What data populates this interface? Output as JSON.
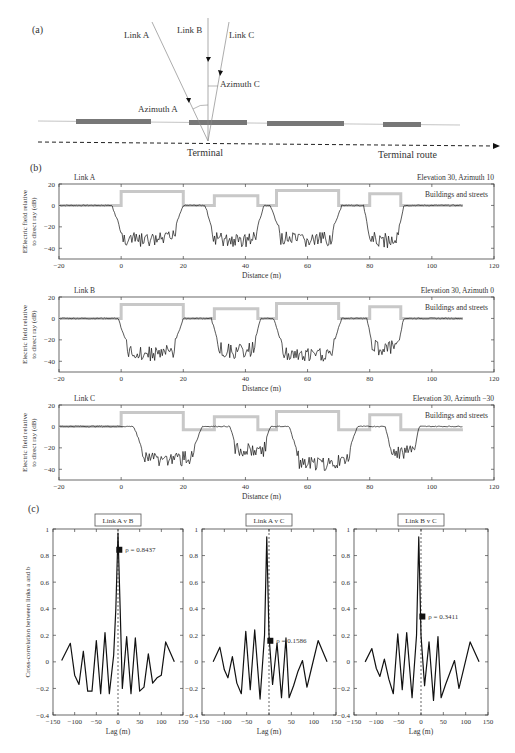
{
  "figure": {
    "panel_labels": {
      "a": "(a)",
      "b": "(b)",
      "c": "(c)"
    }
  },
  "diagram": {
    "links": [
      {
        "name": "Link A",
        "azimuth_label": "Azimuth A"
      },
      {
        "name": "Link B"
      },
      {
        "name": "Link C",
        "azimuth_label": "Azimuth C"
      }
    ],
    "terminal_label": "Terminal",
    "route_label": "Terminal route"
  },
  "chart_data": [
    {
      "type": "line",
      "panel": "b",
      "title": "Link A",
      "subtitle": "Elevation 30, Azimuth 10",
      "legend": "Buildings and streets",
      "xlabel": "Distance (m)",
      "ylabel": "EElectric field relative to direct ray (dB)",
      "xlim": [
        -20,
        120
      ],
      "ylim": [
        -50,
        20
      ],
      "xticks": [
        -20,
        0,
        20,
        40,
        60,
        80,
        100,
        120
      ],
      "yticks": [
        -40,
        -20,
        0,
        20
      ],
      "buildings": [
        [
          -20,
          0
        ],
        [
          0,
          0
        ],
        [
          0,
          13
        ],
        [
          20,
          13
        ],
        [
          20,
          0
        ],
        [
          30,
          0
        ],
        [
          30,
          9
        ],
        [
          44,
          9
        ],
        [
          44,
          0
        ],
        [
          50,
          0
        ],
        [
          50,
          14
        ],
        [
          70,
          14
        ],
        [
          70,
          0
        ],
        [
          80,
          0
        ],
        [
          80,
          11
        ],
        [
          90,
          11
        ],
        [
          90,
          0
        ],
        [
          110,
          0
        ]
      ],
      "field_dips": [
        {
          "start": -3,
          "end": 20,
          "min": -30
        },
        {
          "start": 27,
          "end": 46,
          "min": -30
        },
        {
          "start": 48,
          "end": 71,
          "min": -30
        },
        {
          "start": 78,
          "end": 91,
          "min": -30
        }
      ]
    },
    {
      "type": "line",
      "panel": "b",
      "title": "Link B",
      "subtitle": "Elevation 30, Azimuth 0",
      "legend": "Buildings and streets",
      "xlabel": "Distance (m)",
      "ylabel": "Electric field relative to direct ray (dB)",
      "xlim": [
        -20,
        120
      ],
      "ylim": [
        -50,
        20
      ],
      "xticks": [
        -20,
        0,
        20,
        40,
        60,
        80,
        100,
        120
      ],
      "yticks": [
        -40,
        -20,
        0,
        20
      ],
      "buildings": [
        [
          -20,
          0
        ],
        [
          0,
          0
        ],
        [
          0,
          13
        ],
        [
          20,
          13
        ],
        [
          20,
          0
        ],
        [
          30,
          0
        ],
        [
          30,
          9
        ],
        [
          44,
          9
        ],
        [
          44,
          0
        ],
        [
          50,
          0
        ],
        [
          50,
          14
        ],
        [
          70,
          14
        ],
        [
          70,
          0
        ],
        [
          80,
          0
        ],
        [
          80,
          11
        ],
        [
          90,
          11
        ],
        [
          90,
          0
        ],
        [
          110,
          0
        ]
      ],
      "field_dips": [
        {
          "start": -1,
          "end": 20,
          "min": -30
        },
        {
          "start": 29,
          "end": 45,
          "min": -28
        },
        {
          "start": 49,
          "end": 71,
          "min": -32
        },
        {
          "start": 79,
          "end": 91,
          "min": -25
        }
      ]
    },
    {
      "type": "line",
      "panel": "b",
      "title": "Link C",
      "subtitle": "Elevation 30, Azimuth −30",
      "legend": "Buildings and streets",
      "xlabel": "Distance (m)",
      "ylabel": "Electric field relative to direct ray (dB)",
      "xlim": [
        -20,
        120
      ],
      "ylim": [
        -50,
        20
      ],
      "xticks": [
        -20,
        0,
        20,
        40,
        60,
        80,
        100,
        120
      ],
      "yticks": [
        -40,
        -20,
        0,
        20
      ],
      "buildings": [
        [
          -20,
          0
        ],
        [
          0,
          0
        ],
        [
          0,
          13
        ],
        [
          20,
          13
        ],
        [
          20,
          -3
        ],
        [
          30,
          -3
        ],
        [
          30,
          9
        ],
        [
          44,
          9
        ],
        [
          44,
          -3
        ],
        [
          50,
          -3
        ],
        [
          50,
          14
        ],
        [
          70,
          14
        ],
        [
          70,
          -3
        ],
        [
          80,
          -3
        ],
        [
          80,
          11
        ],
        [
          90,
          11
        ],
        [
          90,
          -3
        ],
        [
          110,
          -3
        ]
      ],
      "field_dips": [
        {
          "start": 4,
          "end": 26,
          "min": -28
        },
        {
          "start": 35,
          "end": 48,
          "min": -20
        },
        {
          "start": 54,
          "end": 76,
          "min": -32
        },
        {
          "start": 85,
          "end": 96,
          "min": -22
        }
      ]
    },
    {
      "type": "line",
      "panel": "c",
      "title": "Link A v B",
      "xlabel": "Lag (m)",
      "ylabel": "Cross-correlation between links a and b",
      "xlim": [
        -150,
        150
      ],
      "ylim": [
        -0.4,
        1
      ],
      "xticks": [
        -150,
        -100,
        -50,
        0,
        50,
        100,
        150
      ],
      "yticks": [
        -0.4,
        -0.2,
        0,
        0.2,
        0.4,
        0.6,
        0.8,
        1
      ],
      "x": [
        -130,
        -110,
        -100,
        -90,
        -80,
        -70,
        -60,
        -50,
        -40,
        -30,
        -20,
        -10,
        -5,
        0,
        5,
        10,
        20,
        30,
        40,
        50,
        60,
        70,
        80,
        90,
        100,
        110,
        130
      ],
      "y": [
        0.01,
        0.14,
        -0.1,
        -0.17,
        0.08,
        -0.22,
        -0.22,
        0.16,
        -0.24,
        0.22,
        -0.24,
        0.05,
        0.4,
        0.97,
        0.4,
        -0.2,
        0.19,
        -0.24,
        0.18,
        -0.22,
        -0.19,
        0.06,
        -0.16,
        -0.12,
        -0.1,
        0.15,
        0.0
      ],
      "marker": {
        "x": 3,
        "y": 0.8437,
        "label": "ρ = 0.8437"
      }
    },
    {
      "type": "line",
      "panel": "c",
      "title": "Link A v C",
      "xlabel": "Lag (m)",
      "ylabel": "",
      "xlim": [
        -150,
        150
      ],
      "ylim": [
        -0.4,
        1
      ],
      "xticks": [
        -150,
        -100,
        -50,
        0,
        50,
        100,
        150
      ],
      "yticks": [
        -0.4,
        -0.2,
        0,
        0.2,
        0.4,
        0.6,
        0.8,
        1
      ],
      "x": [
        -125,
        -110,
        -100,
        -92,
        -82,
        -72,
        -62,
        -52,
        -42,
        -32,
        -20,
        -10,
        -5,
        0,
        8,
        18,
        28,
        38,
        45,
        55,
        65,
        75,
        85,
        95,
        110,
        130
      ],
      "y": [
        0.0,
        0.11,
        -0.06,
        -0.12,
        0.04,
        -0.16,
        -0.24,
        0.23,
        -0.21,
        0.24,
        -0.28,
        0.2,
        0.94,
        0.2,
        -0.17,
        0.14,
        -0.27,
        0.18,
        -0.27,
        -0.18,
        -0.07,
        0.01,
        -0.19,
        -0.05,
        0.16,
        0.0
      ],
      "marker": {
        "x": 3,
        "y": 0.1586,
        "label": "ρ = 0.1586"
      }
    },
    {
      "type": "line",
      "panel": "c",
      "title": "Link B v C",
      "xlabel": "Lag (m)",
      "ylabel": "",
      "xlim": [
        -150,
        150
      ],
      "ylim": [
        -0.4,
        1
      ],
      "xticks": [
        -150,
        -100,
        -50,
        0,
        50,
        100,
        150
      ],
      "yticks": [
        -0.4,
        -0.2,
        0,
        0.2,
        0.4,
        0.6,
        0.8,
        1
      ],
      "x": [
        -125,
        -110,
        -100,
        -92,
        -82,
        -72,
        -62,
        -52,
        -42,
        -32,
        -20,
        -10,
        -5,
        0,
        8,
        18,
        28,
        38,
        45,
        55,
        65,
        75,
        85,
        95,
        110,
        130
      ],
      "y": [
        0.0,
        0.1,
        -0.05,
        -0.11,
        0.02,
        -0.13,
        -0.24,
        0.21,
        -0.21,
        0.22,
        -0.27,
        0.2,
        0.94,
        0.2,
        -0.18,
        0.15,
        -0.29,
        0.19,
        -0.27,
        -0.17,
        -0.08,
        0.01,
        -0.2,
        -0.06,
        0.15,
        0.0
      ],
      "marker": {
        "x": 3,
        "y": 0.3411,
        "label": "ρ = 0.3411"
      }
    }
  ],
  "colors": {
    "signal": "#111111",
    "buildings": "#c8c8c8",
    "axis": "#444444",
    "text": "#333333"
  }
}
